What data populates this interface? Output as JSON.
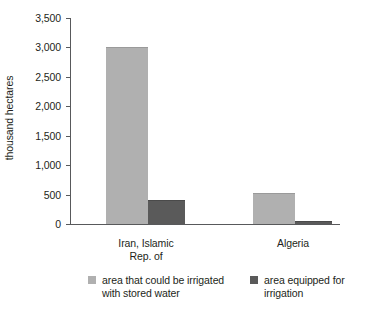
{
  "chart_data": {
    "type": "bar",
    "title": "",
    "xlabel": "",
    "ylabel": "thousand hectares",
    "ylim": [
      0,
      3500
    ],
    "ytick_values": [
      3500,
      3000,
      2500,
      2000,
      1500,
      1000,
      500,
      0
    ],
    "ytick_labels": [
      "3,500",
      "3,000",
      "2,500",
      "2,000",
      "1,500",
      "1,000",
      "500",
      "0"
    ],
    "grid": false,
    "legend_position": "bottom",
    "categories": [
      "Iran, Islamic Rep. of",
      "Algeria"
    ],
    "category_lines": [
      [
        "Iran, Islamic",
        "Rep. of"
      ],
      [
        "Algeria"
      ]
    ],
    "series": [
      {
        "name": "area that could be irrigated with stored water",
        "name_lines": [
          "area that could be irrigated",
          "with stored water"
        ],
        "color": "#b0b0b0",
        "values": [
          3000,
          525
        ]
      },
      {
        "name": "area equipped for irrigation",
        "name_lines": [
          "area equipped for",
          "irrigation"
        ],
        "color": "#5a5a5a",
        "values": [
          410,
          50
        ]
      }
    ]
  },
  "colors": {
    "axis": "#58595b",
    "text": "#231f20",
    "series_light": "#b0b0b0",
    "series_dark": "#5a5a5a",
    "background": "#ffffff"
  }
}
